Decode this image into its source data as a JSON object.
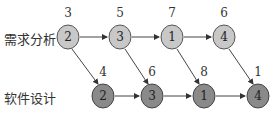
{
  "rows": [
    {
      "label": "需求分析",
      "fill": "#c8c8c8"
    },
    {
      "label": "软件设计",
      "fill": "#8a8a8a"
    }
  ],
  "nodes": {
    "r0": [
      {
        "value": "2",
        "top": "3"
      },
      {
        "value": "3",
        "top": "5"
      },
      {
        "value": "1",
        "top": "7"
      },
      {
        "value": "4",
        "top": "6"
      }
    ],
    "r1": [
      {
        "value": "2",
        "top": "4"
      },
      {
        "value": "3",
        "top": "6"
      },
      {
        "value": "1",
        "top": "8"
      },
      {
        "value": "4",
        "top": "1"
      }
    ]
  }
}
